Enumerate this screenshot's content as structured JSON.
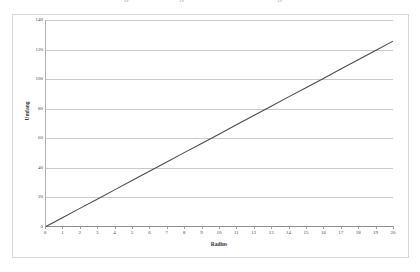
{
  "page": {
    "clipped_caption": "Abbildung: Zusammenhang zwischen Radius und Umfang eines Kreises"
  },
  "chart_data": {
    "type": "line",
    "title": "",
    "xlabel": "Radius",
    "ylabel": "Umfang",
    "xlim": [
      0,
      20
    ],
    "ylim": [
      0,
      140
    ],
    "grid": "horizontal",
    "legend": "none",
    "line_color": "#4a4a55",
    "gridline_color": "#c9c9c9",
    "background": "#ffffff",
    "x_ticks": [
      0,
      1,
      2,
      3,
      4,
      5,
      6,
      7,
      8,
      9,
      10,
      11,
      12,
      13,
      14,
      15,
      16,
      17,
      18,
      19,
      20
    ],
    "y_ticks": [
      0,
      20,
      40,
      60,
      80,
      100,
      120,
      140
    ],
    "series": [
      {
        "name": "Umfang",
        "x": [
          0,
          1,
          2,
          3,
          4,
          5,
          6,
          7,
          8,
          9,
          10,
          11,
          12,
          13,
          14,
          15,
          16,
          17,
          18,
          19,
          20
        ],
        "values": [
          0,
          6.3,
          12.6,
          18.8,
          25.1,
          31.4,
          37.7,
          44.0,
          50.3,
          56.5,
          62.8,
          69.1,
          75.4,
          81.7,
          88.0,
          94.2,
          100.5,
          106.8,
          113.1,
          119.4,
          125.7
        ]
      }
    ]
  }
}
